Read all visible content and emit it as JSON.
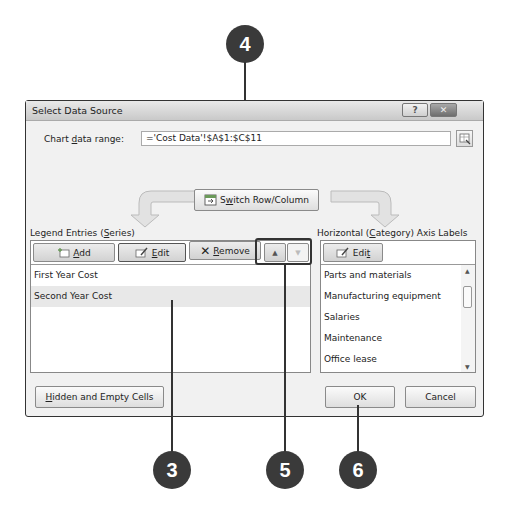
{
  "dialog": {
    "title": "Select Data Source",
    "help_label": "?",
    "close_label": "✕"
  },
  "range": {
    "label_pre": "Chart ",
    "label_u": "d",
    "label_post": "ata range:",
    "value": "='Cost Data'!$A$1:$C$11"
  },
  "switch_button": {
    "label_pre": "S",
    "label_u": "w",
    "label_post": "itch Row/Column"
  },
  "legend": {
    "heading_pre": "Legend Entries (",
    "heading_u": "S",
    "heading_post": "eries)",
    "add_label_u": "A",
    "add_label_post": "dd",
    "edit_label_u": "E",
    "edit_label_post": "dit",
    "remove_label_u": "R",
    "remove_label_post": "emove",
    "move_up_icon": "▲",
    "move_down_icon": "▼",
    "items": [
      {
        "label": "First Year Cost",
        "selected": false
      },
      {
        "label": "Second Year Cost",
        "selected": true
      }
    ]
  },
  "axis": {
    "heading_pre": "Horizontal (",
    "heading_u": "C",
    "heading_post": "ategory) Axis Labels",
    "edit_label_pre": "Edi",
    "edit_label_u": "t",
    "items": [
      {
        "label": "Parts and materials"
      },
      {
        "label": "Manufacturing equipment"
      },
      {
        "label": "Salaries"
      },
      {
        "label": "Maintenance"
      },
      {
        "label": "Office lease"
      }
    ]
  },
  "footer": {
    "hidden_cells_u": "H",
    "hidden_cells_post": "idden and Empty Cells",
    "ok_label": "OK",
    "cancel_label": "Cancel"
  },
  "callouts": [
    {
      "number": "4"
    },
    {
      "number": "3"
    },
    {
      "number": "5"
    },
    {
      "number": "6"
    }
  ]
}
